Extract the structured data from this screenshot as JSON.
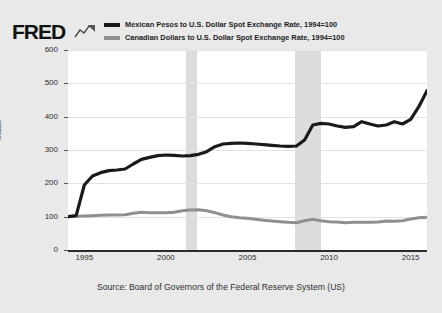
{
  "brand": {
    "name": "FRED",
    "squiggle_icon": "fred-squiggle-icon"
  },
  "legend": {
    "position": "top",
    "entries": [
      {
        "label": "Mexican Pesos to U.S. Dollar Spot Exchange Rate, 1994=100",
        "color": "#1a1a1a"
      },
      {
        "label": "Canadian Dollars to U.S. Dollar Spot Exchange Rate, 1994=100",
        "color": "#8f8f8f"
      }
    ]
  },
  "footer": {
    "source": "Source: Board of Governors of the Federal Reserve System (US)"
  },
  "chart_data": {
    "type": "line",
    "title": "",
    "subtitle": "",
    "xlabel": "",
    "ylabel": "Index",
    "xlim": [
      1994,
      2016
    ],
    "ylim": [
      0,
      600
    ],
    "ytick_labels": [
      "0",
      "100",
      "200",
      "300",
      "400",
      "500",
      "600"
    ],
    "ytick_values": [
      0,
      100,
      200,
      300,
      400,
      500,
      600
    ],
    "xtick_labels": [
      "1995",
      "2000",
      "2005",
      "2010",
      "2015"
    ],
    "xtick_values": [
      1995,
      2000,
      2005,
      2010,
      2015
    ],
    "grid": true,
    "grid_axis": "y",
    "legend_position": "top",
    "shaded_regions": [
      {
        "name": "recession-2001",
        "start": 2001.25,
        "end": 2001.92,
        "color": "#dcdcdc"
      },
      {
        "name": "recession-2008",
        "start": 2007.92,
        "end": 2009.5,
        "color": "#dcdcdc"
      }
    ],
    "x": [
      1994,
      1994.5,
      1995,
      1995.5,
      1996,
      1996.5,
      1997,
      1997.5,
      1998,
      1998.5,
      1999,
      1999.5,
      2000,
      2000.5,
      2001,
      2001.5,
      2002,
      2002.5,
      2003,
      2003.5,
      2004,
      2004.5,
      2005,
      2005.5,
      2006,
      2006.5,
      2007,
      2007.5,
      2008,
      2008.5,
      2009,
      2009.5,
      2010,
      2010.5,
      2011,
      2011.5,
      2012,
      2012.5,
      2013,
      2013.5,
      2014,
      2014.5,
      2015,
      2015.5,
      2016
    ],
    "series": [
      {
        "name": "Mexican Pesos to U.S. Dollar Spot Exchange Rate, 1994=100",
        "color": "#1a1a1a",
        "width": 3.2,
        "values": [
          100,
          103,
          195,
          222,
          232,
          238,
          240,
          243,
          258,
          272,
          278,
          283,
          285,
          284,
          282,
          283,
          287,
          295,
          310,
          318,
          320,
          321,
          320,
          318,
          316,
          314,
          312,
          311,
          312,
          330,
          375,
          380,
          378,
          372,
          368,
          370,
          385,
          378,
          372,
          375,
          385,
          378,
          392,
          430,
          478
        ]
      },
      {
        "name": "Canadian Dollars to U.S. Dollar Spot Exchange Rate, 1994=100",
        "color": "#8f8f8f",
        "width": 3.0,
        "values": [
          100,
          101,
          102,
          103,
          104,
          105,
          105,
          106,
          110,
          113,
          112,
          112,
          112,
          113,
          118,
          120,
          121,
          118,
          112,
          105,
          100,
          97,
          95,
          92,
          89,
          87,
          85,
          83,
          82,
          88,
          92,
          88,
          85,
          84,
          82,
          83,
          83,
          83,
          84,
          87,
          86,
          88,
          93,
          97,
          98
        ]
      }
    ]
  }
}
